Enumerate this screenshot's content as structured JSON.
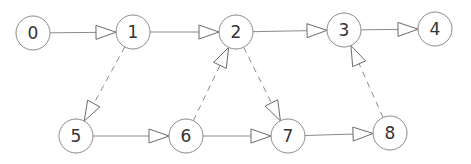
{
  "diagram": {
    "type": "directed-graph",
    "node_radius": 17,
    "colors": {
      "stroke": "#8a8a8a",
      "arrow": "#6a6a6a",
      "text": "#333333",
      "background": "#ffffff"
    },
    "nodes": [
      {
        "id": "0",
        "label": "0",
        "x": 33,
        "y": 33
      },
      {
        "id": "1",
        "label": "1",
        "x": 133,
        "y": 32
      },
      {
        "id": "2",
        "label": "2",
        "x": 236,
        "y": 32
      },
      {
        "id": "3",
        "label": "3",
        "x": 344,
        "y": 30
      },
      {
        "id": "4",
        "label": "4",
        "x": 435,
        "y": 29
      },
      {
        "id": "5",
        "label": "5",
        "x": 76,
        "y": 136
      },
      {
        "id": "6",
        "label": "6",
        "x": 186,
        "y": 136
      },
      {
        "id": "7",
        "label": "7",
        "x": 288,
        "y": 136
      },
      {
        "id": "8",
        "label": "8",
        "x": 390,
        "y": 133
      }
    ],
    "edges": [
      {
        "from": "0",
        "to": "1",
        "style": "solid"
      },
      {
        "from": "1",
        "to": "2",
        "style": "solid"
      },
      {
        "from": "2",
        "to": "3",
        "style": "solid"
      },
      {
        "from": "3",
        "to": "4",
        "style": "solid"
      },
      {
        "from": "5",
        "to": "6",
        "style": "solid"
      },
      {
        "from": "6",
        "to": "7",
        "style": "solid"
      },
      {
        "from": "7",
        "to": "8",
        "style": "solid"
      },
      {
        "from": "1",
        "to": "5",
        "style": "dashed"
      },
      {
        "from": "6",
        "to": "2",
        "style": "dashed"
      },
      {
        "from": "2",
        "to": "7",
        "style": "dashed"
      },
      {
        "from": "8",
        "to": "3",
        "style": "dashed"
      }
    ]
  }
}
